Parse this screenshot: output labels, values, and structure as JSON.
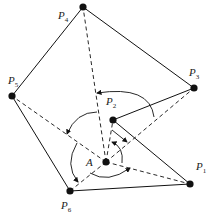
{
  "diagram": {
    "center": {
      "label": "A",
      "x": 106,
      "y": 162
    },
    "points": [
      {
        "id": "P1",
        "base": "P",
        "sub": "1",
        "x": 190,
        "y": 184,
        "lx": 196,
        "ly": 170
      },
      {
        "id": "P2",
        "base": "P",
        "sub": "2",
        "x": 113,
        "y": 120,
        "lx": 106,
        "ly": 105
      },
      {
        "id": "P3",
        "base": "P",
        "sub": "3",
        "x": 194,
        "y": 88,
        "lx": 189,
        "ly": 76
      },
      {
        "id": "P4",
        "base": "P",
        "sub": "4",
        "x": 83,
        "y": 7,
        "lx": 58,
        "ly": 19
      },
      {
        "id": "P5",
        "base": "P",
        "sub": "5",
        "x": 12,
        "y": 96,
        "lx": 8,
        "ly": 84
      },
      {
        "id": "P6",
        "base": "P",
        "sub": "6",
        "x": 70,
        "y": 191,
        "lx": 61,
        "ly": 209
      }
    ],
    "solid_edges": [
      [
        "P1",
        "P6"
      ],
      [
        "P6",
        "P5"
      ],
      [
        "P5",
        "P4"
      ],
      [
        "P4",
        "P3"
      ],
      [
        "P3",
        "P2"
      ],
      [
        "P2",
        "P1"
      ]
    ],
    "dashed_edges": [
      "P1",
      "P2",
      "P3",
      "P4",
      "P5",
      "P6"
    ],
    "center_label": "A",
    "colors": {
      "ink": "#111111",
      "background": "#ffffff"
    }
  }
}
